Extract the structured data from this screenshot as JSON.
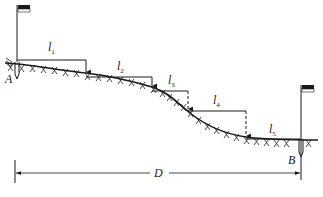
{
  "diagram": {
    "type": "stepped-taping-on-slope",
    "points": {
      "start": {
        "label": "A",
        "x": 17,
        "ground_y": 63
      },
      "end": {
        "label": "B",
        "x": 301,
        "ground_y": 140
      }
    },
    "segments": [
      {
        "label": "l",
        "sub": "1",
        "x1": 17,
        "x2": 86,
        "y": 60,
        "drop_to": 73,
        "dashed": false,
        "label_x": 48,
        "label_y": 51
      },
      {
        "label": "l",
        "sub": "2",
        "x1": 86,
        "x2": 152,
        "y": 77,
        "drop_to": 87,
        "dashed": false,
        "label_x": 117,
        "label_y": 70
      },
      {
        "label": "l",
        "sub": "3",
        "x1": 152,
        "x2": 188,
        "y": 91,
        "drop_to": 110,
        "dashed": true,
        "label_x": 169,
        "label_y": 84
      },
      {
        "label": "l",
        "sub": "4",
        "x1": 188,
        "x2": 246,
        "y": 111,
        "drop_to": 137,
        "dashed": true,
        "label_x": 214,
        "label_y": 104
      },
      {
        "label": "l",
        "sub": "5",
        "x1": 246,
        "x2": 301,
        "y": 139,
        "drop_to": 139,
        "dashed": false,
        "label_x": 270,
        "label_y": 133
      }
    ],
    "total_distance": {
      "label": "D",
      "x1": 15,
      "x2": 301,
      "y": 173
    },
    "colors": {
      "ink": "#1a1a1a",
      "background": "#ffffff"
    }
  },
  "labels": {
    "A": "A",
    "B": "B",
    "D": "D",
    "l1": "l",
    "l1_sub": "1",
    "l2": "l",
    "l2_sub": "2",
    "l3": "l",
    "l3_sub": "3",
    "l4": "l",
    "l4_sub": "4",
    "l5": "l",
    "l5_sub": "5"
  }
}
